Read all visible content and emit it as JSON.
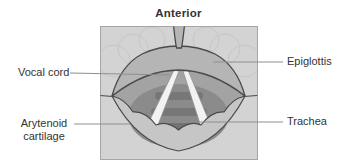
{
  "figure": {
    "title": "Anterior",
    "labels": {
      "vocal_cord": "Vocal cord",
      "epiglottis": "Epiglottis",
      "trachea": "Trachea",
      "arytenoid_line1": "Arytenoid",
      "arytenoid_line2": "cartilage"
    },
    "colors": {
      "panel_background": "#d3d3d3",
      "panel_border": "#a6a6a6",
      "tissue": "#b5b5b5",
      "tissue_light": "#c6c6c6",
      "cavity": "#a3a3a3",
      "cavity_deep": "#8b8b8b",
      "tracheal_ring": "#747474",
      "trachea_deepest": "#6b6b6b",
      "vocal_cord": "#f2f2f2",
      "outline": "#4a4a4a",
      "contour_faint": "#c2c2c2",
      "leader_line": "#8f8f8f",
      "text": "#333333"
    }
  }
}
